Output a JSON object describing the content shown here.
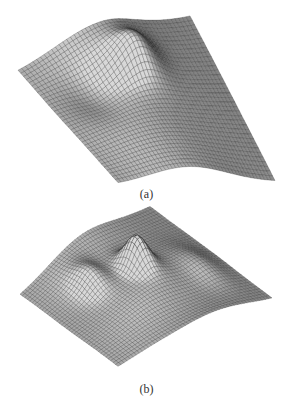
{
  "figure": {
    "panels": [
      {
        "id": "a",
        "caption": "(a)",
        "description": "3D wireframe mesh surface, smooth ridge with a peak, shaded gray"
      },
      {
        "id": "b",
        "caption": "(b)",
        "description": "3D wireframe mesh surface, multiple peaks and folds, shaded gray"
      }
    ],
    "colors": {
      "background": "#ffffff",
      "mesh_line": "#2a2a2a",
      "surface_light": "#d8d8d8",
      "surface_dark": "#3a3a3a"
    }
  }
}
